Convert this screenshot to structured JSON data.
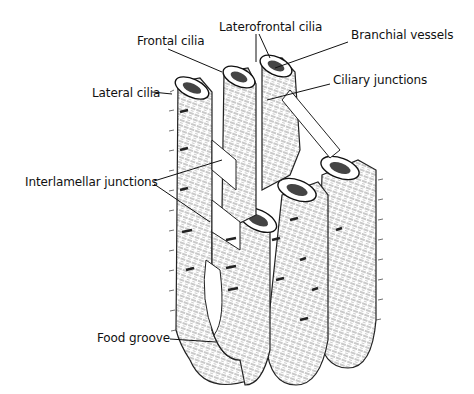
{
  "diagram": {
    "labels": {
      "frontal_cilia": "Frontal cilia",
      "laterofrontal_cilia": "Laterofrontal cilia",
      "branchial_vessels": "Branchial vessels",
      "ciliary_junctions": "Ciliary junctions",
      "lateral_cilia": "Lateral cilia",
      "interlamellar_junctions": "Interlamellar junctions",
      "food_groove": "Food groove"
    },
    "colors": {
      "ink": "#111111",
      "background": "#ffffff",
      "shade": "#9a9a9a"
    }
  }
}
